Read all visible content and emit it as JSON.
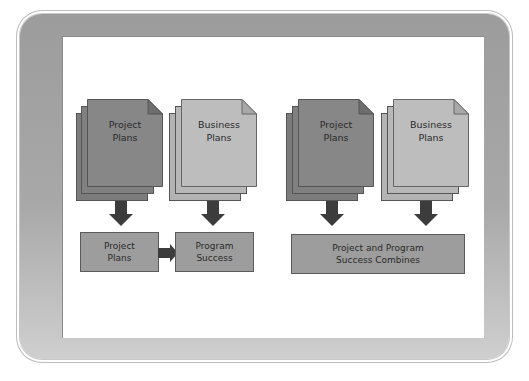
{
  "colors": {
    "project_front": "#878787",
    "project_back": "#7a7a7a",
    "business_front": "#bdbdbd",
    "business_back": "#b0b0b0",
    "arrow": "#3c3c3c",
    "box_fill": "#9d9d9d",
    "frame": "#a4a4a4"
  },
  "left_group": {
    "project_doc": {
      "line1": "Project",
      "line2": "Plans"
    },
    "business_doc": {
      "line1": "Business",
      "line2": "Plans"
    },
    "project_box": "Project\nPlans",
    "program_box": "Program\nSuccess"
  },
  "right_group": {
    "project_doc": {
      "line1": "Project",
      "line2": "Plans"
    },
    "business_doc": {
      "line1": "Business",
      "line2": "Plans"
    },
    "combined_box": "Project and Program\nSuccess Combines"
  }
}
